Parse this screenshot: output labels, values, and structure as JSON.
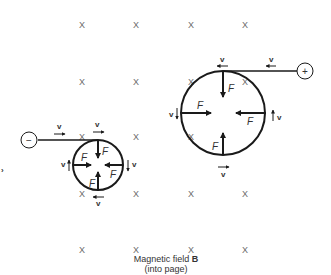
{
  "figure": {
    "field_symbol": "X",
    "caption_line1_prefix": "Magnetic field ",
    "caption_line1_bold": "B",
    "caption_line2": "(into page)",
    "velocity_label": "v",
    "force_label": "F",
    "positive_charge_sign": "+",
    "negative_charge_sign": "−"
  },
  "grid": {
    "columns_x": [
      82,
      136,
      191,
      245
    ],
    "rows_y": [
      25,
      82,
      137,
      194,
      250
    ]
  },
  "particles": [
    {
      "name": "positive-charge",
      "sign": "+",
      "circle": {
        "cx": 223,
        "cy": 113,
        "r": 42
      },
      "motion": "counterclockwise"
    },
    {
      "name": "negative-charge",
      "sign": "−",
      "circle": {
        "cx": 98,
        "cy": 165,
        "r": 25
      },
      "motion": "clockwise"
    }
  ],
  "colors": {
    "line": "#1a1a1a",
    "field_marks": "#6a6a6a",
    "background": "#ffffff"
  }
}
